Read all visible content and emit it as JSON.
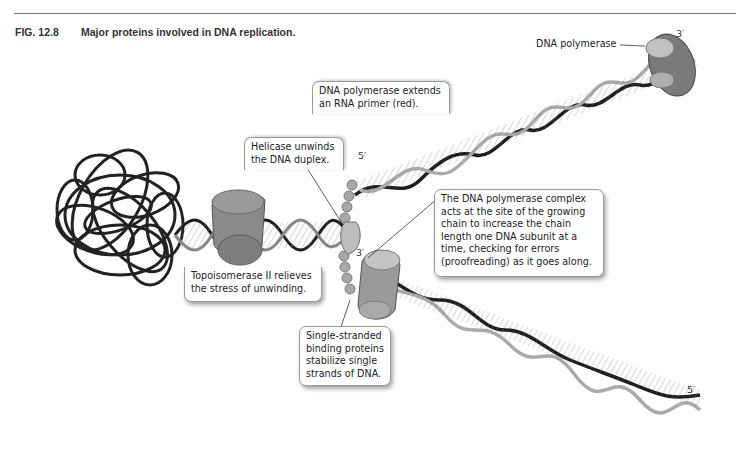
{
  "figure": {
    "number": "FIG. 12.8",
    "title": "Major proteins involved in DNA replication."
  },
  "labels": {
    "dna_polymerase_top": "DNA polymerase",
    "primer_callout": "DNA polymerase extends\nan RNA primer (red).",
    "helicase_callout": "Helicase unwinds\nthe DNA duplex.",
    "polymerase_complex_callout": "The DNA polymerase complex\nacts at the site of the growing\nchain to increase the chain\nlength one DNA subunit at a\ntime, checking for errors\n(proofreading) as it goes along.",
    "topoisomerase_callout": "Topoisomerase II relieves\nthe stress of unwinding.",
    "ssb_callout": "Single-stranded\nbinding proteins\nstabilize single\nstrands of DNA."
  },
  "strand_ends": {
    "top_strand_3prime": "3′",
    "top_strand_5prime": "5′",
    "lagging_3prime": "3′",
    "bottom_strand_5prime": "5′"
  },
  "colors": {
    "protein_gray": "#8a8a8a",
    "protein_light": "#b5b5b5",
    "helix_dark": "#1e1e1e",
    "helix_light": "#9a9a9a",
    "ssb_bead": "#a8a8a8"
  }
}
